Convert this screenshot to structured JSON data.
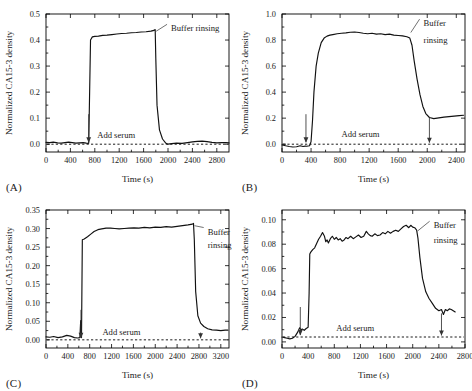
{
  "figure": {
    "panel_labels": [
      "(A)",
      "(B)",
      "(C)",
      "(D)"
    ],
    "shared": {
      "xlabel": "Time (s)",
      "ylabel": "Normalized CA15-3 density",
      "annotation_add_serum": "Add serum",
      "annotation_buffer_rinsing": "Buffer rinsing",
      "annotation_buffer": "Buffer",
      "annotation_rinsing": "rinsing",
      "curve_color": "#111111",
      "axis_color": "#000000",
      "background_color": "#ffffff"
    }
  },
  "chart_data": [
    {
      "type": "line",
      "panel": "(A)",
      "title": "",
      "xlabel": "Time (s)",
      "ylabel": "Normalized CA15-3 density",
      "xlim": [
        0,
        3000
      ],
      "ylim": [
        -0.03,
        0.5
      ],
      "xticks": [
        0,
        400,
        800,
        1200,
        1600,
        2000,
        2400,
        2800
      ],
      "xtick_labels": [
        "0",
        "400",
        "800",
        "1200",
        "1600",
        "2000",
        "2400",
        "2800"
      ],
      "yticks": [
        0.0,
        0.1,
        0.2,
        0.3,
        0.4,
        0.5
      ],
      "ytick_labels": [
        "0.0",
        "0.1",
        "0.2",
        "0.3",
        "0.4",
        "0.5"
      ],
      "grid": false,
      "baseline_y": 0.0,
      "events": {
        "add_serum_time": 700,
        "buffer_rinsing_time": 1790,
        "plateau_value": 0.43,
        "final_value": 0.005
      },
      "annotations": [
        {
          "text": "Add serum",
          "x": 1150,
          "y": 0.035
        },
        {
          "text": "Buffer rinsing",
          "x": 2050,
          "y": 0.445
        }
      ],
      "x": [
        0,
        60,
        120,
        190,
        250,
        310,
        370,
        430,
        490,
        550,
        610,
        660,
        690,
        700,
        710,
        730,
        760,
        800,
        860,
        930,
        1000,
        1080,
        1160,
        1240,
        1320,
        1400,
        1480,
        1560,
        1640,
        1720,
        1770,
        1785,
        1790,
        1800,
        1820,
        1860,
        1910,
        1960,
        2000,
        2060,
        2140,
        2230,
        2320,
        2400,
        2480,
        2560,
        2640,
        2720,
        2800,
        2880,
        2950,
        3000
      ],
      "y": [
        0.007,
        0.006,
        0.008,
        0.005,
        0.004,
        0.006,
        0.008,
        0.006,
        0.004,
        0.005,
        0.006,
        0.004,
        0.003,
        0.004,
        0.13,
        0.4,
        0.412,
        0.414,
        0.415,
        0.418,
        0.419,
        0.421,
        0.423,
        0.425,
        0.426,
        0.428,
        0.429,
        0.431,
        0.432,
        0.434,
        0.437,
        0.44,
        0.44,
        0.33,
        0.15,
        0.055,
        0.02,
        0.005,
        0.0,
        0.002,
        0.004,
        0.003,
        0.006,
        0.009,
        0.011,
        0.012,
        0.01,
        0.007,
        0.005,
        0.006,
        0.006,
        0.005
      ]
    },
    {
      "type": "line",
      "panel": "(B)",
      "title": "",
      "xlabel": "Time (s)",
      "ylabel": "Normalized CA15-3 density",
      "xlim": [
        0,
        2520
      ],
      "ylim": [
        -0.06,
        1.0
      ],
      "xticks": [
        0,
        400,
        800,
        1200,
        1600,
        2000,
        2400
      ],
      "xtick_labels": [
        "0",
        "400",
        "800",
        "1200",
        "1600",
        "2000",
        "2400"
      ],
      "yticks": [
        0.0,
        0.2,
        0.4,
        0.6,
        0.8,
        1.0
      ],
      "ytick_labels": [
        "0.0",
        "0.2",
        "0.4",
        "0.6",
        "0.8",
        "1.0"
      ],
      "grid": false,
      "baseline_y": 0.0,
      "events": {
        "add_serum_time": 330,
        "buffer_rinsing_time": 1760,
        "plateau_value": 0.85,
        "final_value": 0.22
      },
      "annotations": [
        {
          "text": "Add serum",
          "x": 1080,
          "y": 0.075
        },
        {
          "text": "Buffer",
          "x": 1950,
          "y": 0.93
        },
        {
          "text": "rinsing",
          "x": 1950,
          "y": 0.8
        }
      ],
      "x": [
        0,
        50,
        100,
        150,
        200,
        250,
        290,
        320,
        340,
        360,
        380,
        400,
        420,
        440,
        470,
        500,
        540,
        580,
        620,
        660,
        700,
        760,
        820,
        880,
        940,
        1000,
        1060,
        1120,
        1180,
        1240,
        1300,
        1360,
        1420,
        1480,
        1540,
        1600,
        1660,
        1720,
        1760,
        1790,
        1820,
        1860,
        1900,
        1940,
        1980,
        2030,
        2090,
        2160,
        2230,
        2300,
        2370,
        2440,
        2500
      ],
      "y": [
        -0.005,
        -0.012,
        -0.018,
        -0.022,
        -0.02,
        -0.012,
        -0.018,
        -0.015,
        -0.016,
        -0.014,
        -0.012,
        0.02,
        0.18,
        0.4,
        0.6,
        0.7,
        0.78,
        0.815,
        0.83,
        0.838,
        0.842,
        0.848,
        0.852,
        0.855,
        0.86,
        0.862,
        0.858,
        0.852,
        0.848,
        0.852,
        0.845,
        0.848,
        0.842,
        0.845,
        0.838,
        0.835,
        0.832,
        0.825,
        0.815,
        0.76,
        0.64,
        0.5,
        0.38,
        0.29,
        0.235,
        0.205,
        0.196,
        0.202,
        0.208,
        0.212,
        0.216,
        0.219,
        0.222
      ]
    },
    {
      "type": "line",
      "panel": "(C)",
      "title": "",
      "xlabel": "Time (s)",
      "ylabel": "Normalized CA15-3 density",
      "xlim": [
        0,
        3350
      ],
      "ylim": [
        -0.022,
        0.35
      ],
      "xticks": [
        0,
        400,
        800,
        1200,
        1600,
        2000,
        2400,
        2800,
        3200
      ],
      "xtick_labels": [
        "0",
        "400",
        "800",
        "1200",
        "1600",
        "2000",
        "2400",
        "2800",
        "3200"
      ],
      "yticks": [
        0.0,
        0.05,
        0.1,
        0.15,
        0.2,
        0.25,
        0.3,
        0.35
      ],
      "ytick_labels": [
        "0.00",
        "0.05",
        "0.10",
        "0.15",
        "0.20",
        "0.25",
        "0.30",
        "0.35"
      ],
      "grid": false,
      "baseline_y": 0.0,
      "events": {
        "add_serum_time": 640,
        "buffer_rinsing_time": 2700,
        "plateau_value": 0.305,
        "final_value": 0.025
      },
      "annotations": [
        {
          "text": "Add serum",
          "x": 1380,
          "y": 0.022
        },
        {
          "text": "Buffer",
          "x": 2960,
          "y": 0.292
        },
        {
          "text": "rinsing",
          "x": 2960,
          "y": 0.255
        }
      ],
      "x": [
        0,
        70,
        140,
        220,
        300,
        380,
        450,
        520,
        580,
        620,
        635,
        640,
        650,
        665,
        700,
        760,
        820,
        880,
        950,
        1020,
        1100,
        1180,
        1260,
        1340,
        1430,
        1520,
        1610,
        1700,
        1800,
        1900,
        2000,
        2100,
        2200,
        2300,
        2400,
        2500,
        2600,
        2680,
        2700,
        2715,
        2740,
        2780,
        2830,
        2890,
        2960,
        3040,
        3120,
        3200,
        3280,
        3330
      ],
      "y": [
        0.008,
        0.007,
        0.009,
        0.006,
        0.008,
        0.012,
        0.01,
        0.006,
        0.005,
        0.006,
        0.052,
        0.015,
        0.006,
        0.27,
        0.272,
        0.278,
        0.285,
        0.292,
        0.297,
        0.299,
        0.301,
        0.301,
        0.3,
        0.299,
        0.3,
        0.301,
        0.302,
        0.301,
        0.303,
        0.302,
        0.304,
        0.303,
        0.305,
        0.304,
        0.306,
        0.308,
        0.31,
        0.312,
        0.314,
        0.27,
        0.13,
        0.065,
        0.045,
        0.036,
        0.03,
        0.027,
        0.026,
        0.025,
        0.026,
        0.026
      ]
    },
    {
      "type": "line",
      "panel": "(D)",
      "title": "",
      "xlabel": "Time (s)",
      "ylabel": "Normalized CA15-3 density",
      "xlim": [
        0,
        2800
      ],
      "ylim": [
        -0.005,
        0.108
      ],
      "xticks": [
        0,
        400,
        800,
        1200,
        1600,
        2000,
        2400,
        2800
      ],
      "xtick_labels": [
        "0",
        "400",
        "800",
        "1200",
        "1600",
        "2000",
        "2400",
        "2800"
      ],
      "yticks": [
        0.0,
        0.02,
        0.04,
        0.06,
        0.08,
        0.1
      ],
      "ytick_labels": [
        "0.00",
        "0.02",
        "0.04",
        "0.06",
        "0.08",
        "0.10"
      ],
      "grid": false,
      "baseline_y": 0.004,
      "events": {
        "add_serum_time": 280,
        "buffer_rinsing_time": 2060,
        "plateau_value": 0.09,
        "final_value": 0.025
      },
      "annotations": [
        {
          "text": "Add serum",
          "x": 1120,
          "y": 0.0115
        },
        {
          "text": "Buffer",
          "x": 2320,
          "y": 0.0955
        },
        {
          "text": "rinsing",
          "x": 2320,
          "y": 0.0835
        }
      ],
      "x": [
        0,
        40,
        80,
        120,
        160,
        200,
        240,
        270,
        290,
        310,
        340,
        370,
        400,
        415,
        425,
        440,
        470,
        500,
        530,
        560,
        590,
        620,
        650,
        670,
        690,
        710,
        740,
        770,
        800,
        830,
        860,
        890,
        920,
        950,
        980,
        1010,
        1050,
        1090,
        1130,
        1170,
        1210,
        1250,
        1290,
        1320,
        1350,
        1380,
        1420,
        1460,
        1500,
        1540,
        1580,
        1620,
        1660,
        1700,
        1740,
        1780,
        1820,
        1860,
        1900,
        1940,
        1970,
        2000,
        2030,
        2060,
        2080,
        2110,
        2150,
        2200,
        2250,
        2300,
        2350,
        2400,
        2440,
        2470,
        2500,
        2530,
        2560,
        2590,
        2620,
        2650
      ],
      "y": [
        0.004,
        0.0035,
        0.003,
        0.0025,
        0.003,
        0.0045,
        0.008,
        0.0115,
        0.01,
        0.0105,
        0.0095,
        0.011,
        0.012,
        0.04,
        0.072,
        0.0735,
        0.0755,
        0.077,
        0.0805,
        0.084,
        0.0865,
        0.0895,
        0.0865,
        0.082,
        0.0835,
        0.081,
        0.0845,
        0.0865,
        0.084,
        0.0855,
        0.0835,
        0.0845,
        0.0825,
        0.0835,
        0.0855,
        0.0845,
        0.0865,
        0.0845,
        0.086,
        0.0875,
        0.0855,
        0.0865,
        0.0905,
        0.0885,
        0.087,
        0.0865,
        0.0885,
        0.087,
        0.0875,
        0.0895,
        0.0885,
        0.0905,
        0.089,
        0.0905,
        0.0915,
        0.0905,
        0.0925,
        0.0945,
        0.0955,
        0.0935,
        0.0955,
        0.094,
        0.0935,
        0.0915,
        0.085,
        0.069,
        0.052,
        0.041,
        0.0355,
        0.0315,
        0.0275,
        0.0255,
        0.0265,
        0.0225,
        0.0265,
        0.0255,
        0.027,
        0.0265,
        0.0255,
        0.0245
      ]
    }
  ]
}
